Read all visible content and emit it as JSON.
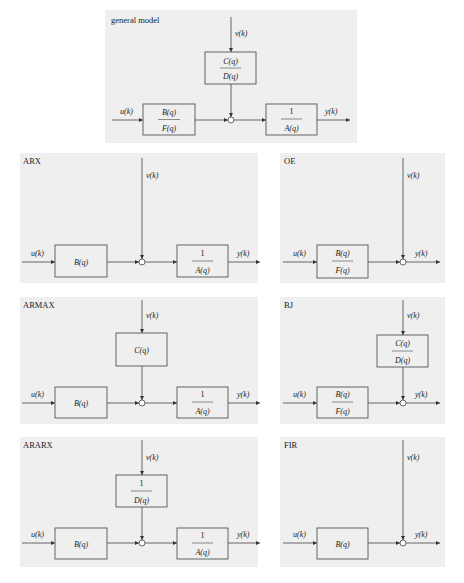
{
  "figure": {
    "panels": [
      {
        "id": "general",
        "title": "general model",
        "input": "u(k)",
        "output": "y(k)",
        "noise": "v(k)",
        "plant": {
          "num": "B(q)",
          "den": "F(q)"
        },
        "noise_filter": {
          "num": "C(q)",
          "den": "D(q)"
        },
        "output_block": {
          "num": "1",
          "den": "A(q)"
        }
      },
      {
        "id": "arx",
        "title": "ARX",
        "input": "u(k)",
        "output": "y(k)",
        "noise": "v(k)",
        "plant": {
          "label": "B(q)"
        },
        "output_block": {
          "num": "1",
          "den": "A(q)"
        }
      },
      {
        "id": "oe",
        "title": "OE",
        "input": "u(k)",
        "output": "y(k)",
        "noise": "v(k)",
        "plant": {
          "num": "B(q)",
          "den": "F(q)"
        }
      },
      {
        "id": "armax",
        "title": "ARMAX",
        "input": "u(k)",
        "output": "y(k)",
        "noise": "v(k)",
        "plant": {
          "label": "B(q)"
        },
        "noise_filter": {
          "label": "C(q)"
        },
        "output_block": {
          "num": "1",
          "den": "A(q)"
        }
      },
      {
        "id": "bj",
        "title": "BJ",
        "input": "u(k)",
        "output": "y(k)",
        "noise": "v(k)",
        "plant": {
          "num": "B(q)",
          "den": "F(q)"
        },
        "noise_filter": {
          "num": "C(q)",
          "den": "D(q)"
        }
      },
      {
        "id": "ararx",
        "title": "ARARX",
        "input": "u(k)",
        "output": "y(k)",
        "noise": "v(k)",
        "plant": {
          "label": "B(q)"
        },
        "noise_filter": {
          "num": "1",
          "den": "D(q)"
        },
        "output_block": {
          "num": "1",
          "den": "A(q)"
        }
      },
      {
        "id": "fir",
        "title": "FIR",
        "input": "u(k)",
        "output": "y(k)",
        "noise": "v(k)",
        "plant": {
          "label": "B(q)"
        }
      }
    ],
    "colors": {
      "panel_background": "#efefef",
      "line": "#444444",
      "page_background": "#ffffff"
    }
  }
}
